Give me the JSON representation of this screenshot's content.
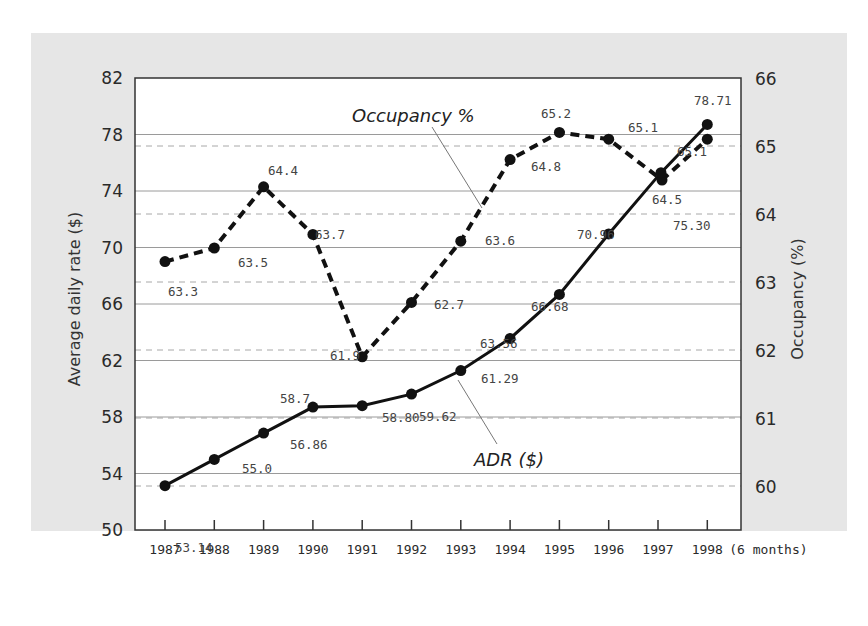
{
  "chart_data": {
    "type": "line",
    "title": "",
    "x": [
      "1987",
      "1988",
      "1989",
      "1990",
      "1991",
      "1992",
      "1993",
      "1994",
      "1995",
      "1996",
      "1997",
      "1998"
    ],
    "x_suffix_label": "(6 months)",
    "xlabel": "",
    "ylabel_left": "Average daily rate ($)",
    "ylabel_right": "Occupancy (%)",
    "ylim_left": [
      50,
      82
    ],
    "yticks_left": [
      50,
      54,
      58,
      62,
      66,
      70,
      74,
      78,
      82
    ],
    "ylim_right": [
      60,
      66
    ],
    "yticks_right": [
      60,
      61,
      62,
      63,
      64,
      65,
      66
    ],
    "grid": true,
    "legend": "inline annotations",
    "series": [
      {
        "name": "ADR ($)",
        "axis": "left",
        "style": "solid",
        "values": [
          53.14,
          55.0,
          56.86,
          58.7,
          58.8,
          59.62,
          61.29,
          63.56,
          66.68,
          70.96,
          75.3,
          78.71
        ],
        "labels": [
          "53.14",
          "55.0",
          "56.86",
          "58.7",
          "58.80",
          "59.62",
          "61.29",
          "63.56",
          "66.68",
          "70.96",
          "75.30",
          "78.71"
        ]
      },
      {
        "name": "Occupancy %",
        "axis": "right",
        "style": "dashed",
        "values": [
          63.3,
          63.5,
          64.4,
          63.7,
          61.9,
          62.7,
          63.6,
          64.8,
          65.2,
          65.1,
          64.5,
          65.1
        ],
        "labels": [
          "63.3",
          "63.5",
          "64.4",
          "63.7",
          "61.9",
          "62.7",
          "63.6",
          "64.8",
          "65.2",
          "65.1",
          "64.5",
          "65.1"
        ]
      }
    ]
  },
  "labels": {
    "occupancy_series": "Occupancy %",
    "adr_series": "ADR ($)"
  },
  "colors": {
    "panel_bg": "#e6e6e6",
    "plot_bg": "#ffffff",
    "line": "#111111",
    "grid": "#9a9a9a"
  }
}
